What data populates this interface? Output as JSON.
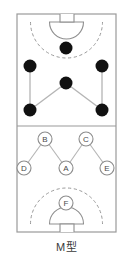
{
  "caption": "M型",
  "diagram": {
    "title": "M型",
    "type": "court-formation-diagram",
    "sport": "handball",
    "court": {
      "x": 17,
      "y": 14,
      "width": 99,
      "height": 218,
      "border_color": "#9a9a9a",
      "fill_color": "#ffffff",
      "center_line_y": 126
    },
    "goals": [
      {
        "name": "top-goal",
        "rect": {
          "x": 60,
          "y": 14,
          "width": 14,
          "height": 8
        },
        "crease": {
          "cx": 66.5,
          "cy": 22,
          "r": 17
        },
        "dashed_arc": {
          "cx": 66.5,
          "cy": 22,
          "r": 36
        }
      },
      {
        "name": "bottom-goal",
        "rect": {
          "x": 60,
          "y": 224,
          "width": 14,
          "height": 8
        },
        "crease": {
          "cx": 66.5,
          "cy": 224,
          "r": 17
        },
        "dashed_arc": {
          "cx": 66.5,
          "cy": 224,
          "r": 36
        }
      }
    ],
    "player_dots": [
      {
        "id": "dot-top-center",
        "cx": 66,
        "cy": 48,
        "r": 6.5
      },
      {
        "id": "dot-upper-left",
        "cx": 30,
        "cy": 66,
        "r": 6.5
      },
      {
        "id": "dot-upper-right",
        "cx": 102,
        "cy": 66,
        "r": 6.5
      },
      {
        "id": "dot-center",
        "cx": 66,
        "cy": 83,
        "r": 6.5
      },
      {
        "id": "dot-lower-left",
        "cx": 30,
        "cy": 110,
        "r": 6.5
      },
      {
        "id": "dot-lower-right",
        "cx": 102,
        "cy": 110,
        "r": 6.5
      }
    ],
    "dot_links": [
      {
        "from": "dot-upper-left",
        "to": "dot-lower-left"
      },
      {
        "from": "dot-upper-right",
        "to": "dot-lower-right"
      },
      {
        "from": "dot-center",
        "to": "dot-lower-left"
      },
      {
        "from": "dot-center",
        "to": "dot-lower-right"
      }
    ],
    "labeled_positions": [
      {
        "id": "pos-b",
        "label": "B",
        "cx": 45,
        "cy": 139,
        "r": 7
      },
      {
        "id": "pos-c",
        "label": "C",
        "cx": 86,
        "cy": 139,
        "r": 7
      },
      {
        "id": "pos-d",
        "label": "D",
        "cx": 24,
        "cy": 168,
        "r": 7
      },
      {
        "id": "pos-a",
        "label": "A",
        "cx": 66,
        "cy": 168,
        "r": 7
      },
      {
        "id": "pos-e",
        "label": "E",
        "cx": 107,
        "cy": 168,
        "r": 7
      },
      {
        "id": "pos-f",
        "label": "F",
        "cx": 66,
        "cy": 203,
        "r": 7
      }
    ],
    "label_links": [
      {
        "from": "pos-b",
        "to": "pos-d"
      },
      {
        "from": "pos-b",
        "to": "pos-a"
      },
      {
        "from": "pos-c",
        "to": "pos-a"
      },
      {
        "from": "pos-c",
        "to": "pos-e"
      }
    ],
    "colors": {
      "line": "#9a9a9a",
      "dot_fill": "#111111",
      "link": "#b4b4b4",
      "label_stroke": "#8c8c8c",
      "label_text": "#4a4a4a",
      "caption_text": "#3a3a3a"
    }
  }
}
